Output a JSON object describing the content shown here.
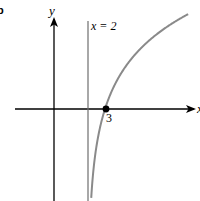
{
  "figure": {
    "part_label": "b",
    "y_axis_label": "y",
    "x_axis_label": "x",
    "asymptote_label": "x = 2",
    "point_label": "3"
  },
  "chart_data": {
    "type": "line",
    "title": "",
    "function": "y = ln(x - 2)",
    "xlabel": "x",
    "ylabel": "y",
    "asymptote": {
      "type": "vertical",
      "x": 2,
      "label": "x = 2"
    },
    "marked_points": [
      {
        "x": 3,
        "y": 0,
        "label": "3"
      }
    ],
    "grid": false,
    "colors": {
      "axes": "#000000",
      "curve": "#808080",
      "asymptote": "#6e6e6e",
      "point": "#000000"
    }
  }
}
